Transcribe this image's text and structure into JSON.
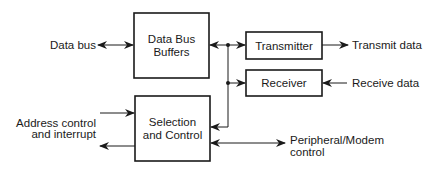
{
  "diagram": {
    "type": "block-diagram",
    "blocks": {
      "data_bus_buffers": {
        "line1": "Data Bus",
        "line2": "Buffers"
      },
      "selection_control": {
        "line1": "Selection",
        "line2": "and Control"
      },
      "transmitter": {
        "label": "Transmitter"
      },
      "receiver": {
        "label": "Receiver"
      }
    },
    "signals": {
      "data_bus": "Data bus",
      "transmit_data": "Transmit data",
      "receive_data": "Receive data",
      "address_line1": "Address control",
      "address_line2": "and interrupt",
      "peripheral_line1": "Peripheral/Modem",
      "peripheral_line2": "control"
    },
    "connections": [
      {
        "from": "Data bus",
        "to": "Data Bus Buffers",
        "direction": "bidirectional"
      },
      {
        "from": "Data Bus Buffers",
        "to": "internal bus",
        "direction": "bidirectional"
      },
      {
        "from": "internal bus",
        "to": "Transmitter",
        "direction": "forward"
      },
      {
        "from": "internal bus",
        "to": "Receiver",
        "direction": "forward"
      },
      {
        "from": "internal bus",
        "to": "Selection and Control",
        "direction": "forward"
      },
      {
        "from": "Transmitter",
        "to": "Transmit data",
        "direction": "forward"
      },
      {
        "from": "Receive data",
        "to": "Receiver",
        "direction": "forward"
      },
      {
        "from": "Address control and interrupt",
        "to": "Selection and Control",
        "direction": "forward"
      },
      {
        "from": "Selection and Control",
        "to": "Address control and interrupt",
        "direction": "forward"
      },
      {
        "from": "Selection and Control",
        "to": "Peripheral/Modem control",
        "direction": "bidirectional"
      }
    ]
  }
}
